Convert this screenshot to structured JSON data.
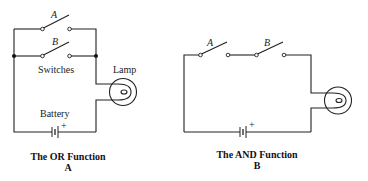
{
  "diagrams": [
    {
      "id": "or",
      "caption": "The OR Function",
      "sublabel": "A",
      "switches": [
        {
          "label": "A"
        },
        {
          "label": "B"
        }
      ],
      "switches_label": "Switches",
      "lamp_label": "Lamp",
      "battery_label": "Battery",
      "battery_polarity": "+"
    },
    {
      "id": "and",
      "caption": "The AND Function",
      "sublabel": "B",
      "switches": [
        {
          "label": "A"
        },
        {
          "label": "B"
        }
      ],
      "battery_polarity": "+"
    }
  ],
  "colors": {
    "line": "#222222",
    "background": "#ffffff"
  }
}
